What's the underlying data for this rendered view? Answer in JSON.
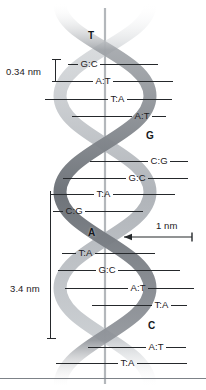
{
  "figure": {
    "background_color": "#ffffff",
    "width": 206,
    "height": 390
  },
  "colors": {
    "strand_dark": "#7d8289",
    "strand_light": "#b9bdc1",
    "axis_line": "#b3b7bb",
    "label_text": "#1d2023",
    "rung_line": "#25282b",
    "bottom_rule": "#7d8288"
  },
  "measurements": [
    {
      "id": "rise",
      "label": "0.34 nm",
      "kind": "vertical-bracket",
      "text_x": 6,
      "text_y": 67,
      "bracket_x": 55,
      "bracket_y": 59,
      "bracket_height": 23
    },
    {
      "id": "pitch",
      "label": "3.4 nm",
      "kind": "vertical-bracket",
      "text_x": 10,
      "text_y": 284,
      "bracket_x": 50,
      "bracket_y": 191,
      "bracket_height": 148
    },
    {
      "id": "diameter",
      "label": "1 nm",
      "kind": "horizontal-arrow",
      "text_x": 156,
      "text_y": 221,
      "arrow_x1": 124,
      "arrow_x2": 192,
      "arrow_y": 237
    }
  ],
  "free_bases": [
    {
      "base": "T",
      "x": 88,
      "y": 31
    },
    {
      "base": "G",
      "x": 146,
      "y": 131
    },
    {
      "base": "A",
      "x": 88,
      "y": 228
    },
    {
      "base": "C",
      "x": 148,
      "y": 321
    }
  ],
  "base_pairs": [
    {
      "pair": "G:C",
      "y": 64,
      "left_x": 68,
      "left_len": 10,
      "right_len": 58
    },
    {
      "pair": "A:T",
      "y": 81,
      "left_x": 55,
      "left_len": 38,
      "right_len": 60
    },
    {
      "pair": "T:A",
      "y": 99,
      "left_x": 45,
      "left_len": 63,
      "right_len": 45
    },
    {
      "pair": "A:T",
      "y": 116,
      "left_x": 72,
      "left_len": 60,
      "right_len": 14
    },
    {
      "pair": "C:G",
      "y": 161,
      "left_x": 90,
      "left_len": 58,
      "right_len": 18
    },
    {
      "pair": "G:C",
      "y": 178,
      "left_x": 63,
      "left_len": 63,
      "right_len": 40
    },
    {
      "pair": "T:A",
      "y": 194,
      "left_x": 50,
      "left_len": 44,
      "right_len": 62
    },
    {
      "pair": "C:G",
      "y": 211,
      "left_x": 53,
      "left_len": 10,
      "right_len": 58
    },
    {
      "pair": "T:A",
      "y": 253,
      "left_x": 62,
      "left_len": 14,
      "right_len": 60
    },
    {
      "pair": "G:C",
      "y": 270,
      "left_x": 58,
      "left_len": 38,
      "right_len": 62
    },
    {
      "pair": "A:T",
      "y": 288,
      "left_x": 65,
      "left_len": 63,
      "right_len": 46
    },
    {
      "pair": "T:A",
      "y": 305,
      "left_x": 92,
      "left_len": 60,
      "right_len": 16
    },
    {
      "pair": "A:T",
      "y": 347,
      "left_x": 88,
      "left_len": 58,
      "right_len": 20
    },
    {
      "pair": "T:A",
      "y": 363,
      "left_x": 56,
      "left_len": 62,
      "right_len": 50
    }
  ]
}
